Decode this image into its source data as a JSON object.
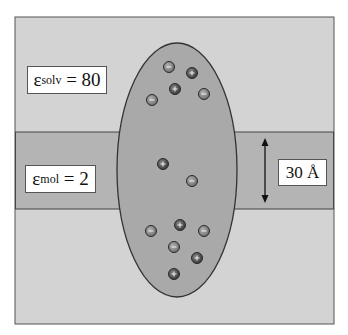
{
  "diagram": {
    "colors": {
      "background": "#ffffff",
      "solvent": "#d3d3d3",
      "membrane_band": "#b4b4b4",
      "molecule": "#a9a9a9",
      "outline": "#333333",
      "positive_charge": "#555555",
      "negative_charge": "#8f8f8f"
    },
    "labels": {
      "solvent": {
        "symbol": "ε",
        "subscript": "solv",
        "rest": " = 80"
      },
      "membrane": {
        "symbol": "ε",
        "subscript": "mol",
        "rest": " = 2"
      },
      "thickness": "30 Å"
    },
    "charges": [
      {
        "sign": "-",
        "x": 169,
        "y": 67
      },
      {
        "sign": "+",
        "x": 192,
        "y": 73
      },
      {
        "sign": "+",
        "x": 175,
        "y": 89
      },
      {
        "sign": "-",
        "x": 152,
        "y": 100
      },
      {
        "sign": "-",
        "x": 204,
        "y": 94
      },
      {
        "sign": "+",
        "x": 163,
        "y": 164
      },
      {
        "sign": "-",
        "x": 192,
        "y": 181
      },
      {
        "sign": "-",
        "x": 151,
        "y": 231
      },
      {
        "sign": "+",
        "x": 180,
        "y": 225
      },
      {
        "sign": "-",
        "x": 204,
        "y": 231
      },
      {
        "sign": "-",
        "x": 174,
        "y": 247
      },
      {
        "sign": "+",
        "x": 197,
        "y": 258
      },
      {
        "sign": "+",
        "x": 174,
        "y": 274
      }
    ]
  }
}
